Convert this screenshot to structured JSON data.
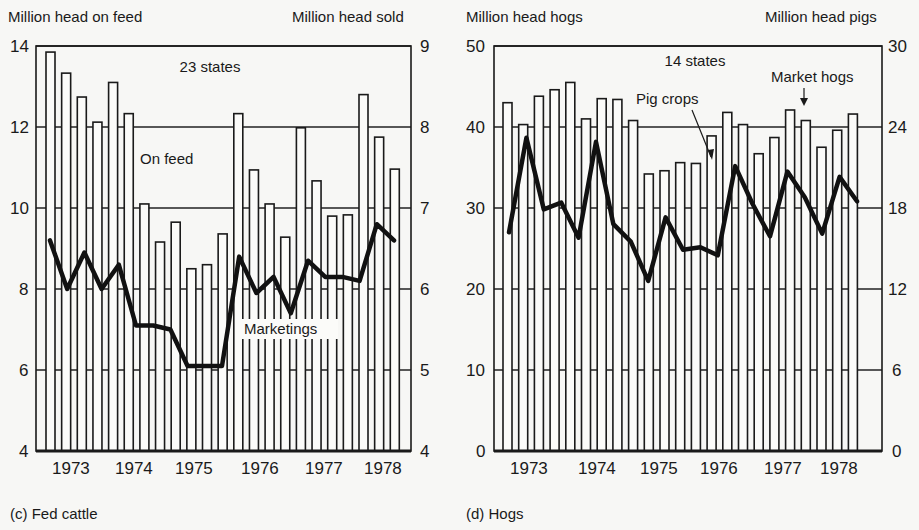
{
  "chart_data": [
    {
      "id": "fed-cattle",
      "type": "bar+line",
      "caption": "(c)  Fed cattle",
      "left_axis_title": "Million head on feed",
      "right_axis_title": "Million head sold",
      "left_ticks": [
        "14",
        "12",
        "10",
        "8",
        "6",
        "4"
      ],
      "right_ticks": [
        "9",
        "8",
        "7",
        "6",
        "5",
        "4"
      ],
      "left_ylim": [
        4,
        14
      ],
      "right_ylim": [
        4,
        9
      ],
      "x_tick_labels": [
        "1973",
        "1974",
        "1975",
        "1976",
        "1977",
        "1978"
      ],
      "annotation_states": "23 states",
      "series": [
        {
          "name": "On feed",
          "kind": "bar",
          "axis": "left",
          "values": [
            13.85,
            13.33,
            12.74,
            12.12,
            13.1,
            12.33,
            10.1,
            9.16,
            9.65,
            8.5,
            8.6,
            9.36,
            12.33,
            10.94,
            10.1,
            9.28,
            11.98,
            10.67,
            9.8,
            9.83,
            12.8,
            11.75,
            10.96
          ]
        },
        {
          "name": "Marketings",
          "kind": "line",
          "axis": "right",
          "values": [
            6.6,
            6.0,
            6.45,
            6.0,
            6.3,
            5.55,
            5.55,
            5.5,
            5.05,
            5.05,
            5.05,
            6.4,
            5.95,
            6.15,
            5.7,
            6.35,
            6.15,
            6.15,
            6.1,
            6.8,
            6.6
          ]
        }
      ],
      "grid": "horizontal at major ticks",
      "legend": "inline labels"
    },
    {
      "id": "hogs",
      "type": "bar+line",
      "caption": "(d)  Hogs",
      "left_axis_title": "Million head hogs",
      "right_axis_title": "Million head pigs",
      "left_ticks": [
        "50",
        "40",
        "30",
        "20",
        "10",
        "0"
      ],
      "right_ticks": [
        "30",
        "24",
        "18",
        "12",
        "6",
        "0"
      ],
      "left_ylim": [
        0,
        50
      ],
      "right_ylim": [
        0,
        30
      ],
      "x_tick_labels": [
        "1973",
        "1974",
        "1975",
        "1976",
        "1977",
        "1978"
      ],
      "annotation_states": "14 states",
      "series": [
        {
          "name": "Market hogs",
          "kind": "bar",
          "axis": "left",
          "values": [
            43.0,
            40.3,
            43.8,
            44.6,
            45.5,
            41.0,
            43.5,
            43.4,
            40.8,
            34.2,
            34.6,
            35.6,
            35.5,
            38.9,
            41.8,
            40.3,
            36.7,
            38.7,
            42.1,
            40.8,
            37.5,
            39.6,
            41.6
          ]
        },
        {
          "name": "Pig crops",
          "kind": "line",
          "axis": "right",
          "values": [
            16.2,
            23.2,
            17.9,
            18.4,
            15.8,
            22.9,
            16.8,
            15.5,
            12.6,
            17.3,
            14.9,
            15.1,
            14.5,
            21.1,
            18.3,
            15.9,
            20.7,
            18.8,
            16.1,
            20.3,
            18.5
          ]
        }
      ],
      "grid": "horizontal at major ticks",
      "legend": "inline labels"
    }
  ],
  "labels": {
    "cattle_on_feed": "On feed",
    "cattle_marketings": "Marketings",
    "hogs_pig_crops": "Pig crops",
    "hogs_market_hogs": "Market hogs"
  }
}
